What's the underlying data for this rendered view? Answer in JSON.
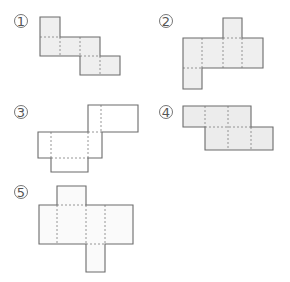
{
  "figures": [
    {
      "label": "1",
      "numeral": {
        "cx": 21,
        "cy": 21
      },
      "fill": "#efefef",
      "cells": [
        [
          40,
          17,
          20,
          20
        ],
        [
          40,
          37,
          20,
          19
        ],
        [
          60,
          37,
          20,
          19
        ],
        [
          80,
          37,
          20,
          19
        ],
        [
          80,
          56,
          20,
          19
        ],
        [
          100,
          56,
          20,
          19
        ]
      ],
      "outline": "M40,17 L60,17 L60,37 L100,37 L100,56 L120,56 L120,75 L80,75 L80,56 L40,56 Z",
      "folds": [
        [
          40,
          37,
          60,
          37
        ],
        [
          60,
          37,
          60,
          56
        ],
        [
          80,
          37,
          80,
          56
        ],
        [
          80,
          56,
          100,
          56
        ],
        [
          100,
          56,
          100,
          75
        ]
      ]
    },
    {
      "label": "2",
      "numeral": {
        "cx": 166,
        "cy": 21
      },
      "fill": "#efefef",
      "outline": "M223,18 L242,18 L242,38 L263,38 L263,68 L202,68 L202,89 L183,89 L183,38 L223,38 Z",
      "folds": [
        [
          223,
          38,
          242,
          38
        ],
        [
          202,
          38,
          202,
          68
        ],
        [
          223,
          38,
          223,
          68
        ],
        [
          242,
          38,
          242,
          68
        ],
        [
          183,
          68,
          202,
          68
        ]
      ]
    },
    {
      "label": "3",
      "numeral": {
        "cx": 21,
        "cy": 112
      },
      "fill": "#ffffff",
      "outline": "M88,105 L138,105 L138,132 L102,132 L102,158 L88,158 L88,172 L51,172 L51,158 L38,158 L38,132 L88,132 Z",
      "folds": [
        [
          101,
          105,
          101,
          132
        ],
        [
          88,
          132,
          102,
          132
        ],
        [
          51,
          132,
          51,
          158
        ],
        [
          88,
          132,
          88,
          158
        ],
        [
          51,
          158,
          88,
          158
        ]
      ]
    },
    {
      "label": "4",
      "numeral": {
        "cx": 166,
        "cy": 112
      },
      "fill": "#ececec",
      "outline": "M183,106 L251,106 L251,127 L273,127 L273,150 L205,150 L205,127 L183,127 Z",
      "folds": [
        [
          205,
          106,
          205,
          127
        ],
        [
          228,
          106,
          228,
          150
        ],
        [
          205,
          127,
          251,
          127
        ],
        [
          251,
          127,
          251,
          150
        ]
      ]
    },
    {
      "label": "5",
      "numeral": {
        "cx": 21,
        "cy": 192
      },
      "fill": "#fafafa",
      "outline": "M57,186 L86,186 L86,205 L133,205 L133,244 L105,244 L105,272 L86,272 L86,244 L39,244 L39,205 L57,205 Z",
      "folds": [
        [
          57,
          205,
          86,
          205
        ],
        [
          57,
          205,
          57,
          244
        ],
        [
          86,
          205,
          86,
          244
        ],
        [
          105,
          205,
          105,
          244
        ],
        [
          86,
          244,
          105,
          244
        ]
      ]
    }
  ],
  "styles": {
    "outline_color": "#6b6b6b",
    "fold_color": "#8a8a8a",
    "numeral_color": "#555555"
  }
}
